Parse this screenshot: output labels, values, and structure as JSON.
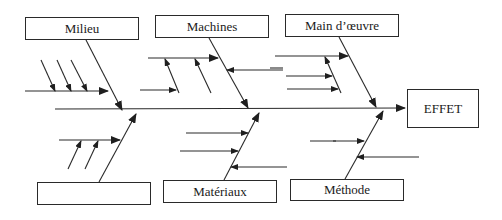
{
  "diagram": {
    "type": "ishikawa",
    "effect": {
      "label": "EFFET"
    },
    "categories": [
      {
        "id": "milieu",
        "label": "Milieu",
        "position": "top",
        "sub_causes": 4
      },
      {
        "id": "machines",
        "label": "Machines",
        "position": "top",
        "sub_causes": 5
      },
      {
        "id": "main_oeuvre",
        "label": "Main d’œuvre",
        "position": "top",
        "sub_causes": 5
      },
      {
        "id": "blank",
        "label": "",
        "position": "bottom",
        "sub_causes": 3
      },
      {
        "id": "materiaux",
        "label": "Matériaux",
        "position": "bottom",
        "sub_causes": 3
      },
      {
        "id": "methode",
        "label": "Méthode",
        "position": "bottom",
        "sub_causes": 2
      }
    ],
    "colors": {
      "line": "#2a2a2a",
      "background": "#ffffff",
      "text": "#1a1a1a"
    }
  }
}
